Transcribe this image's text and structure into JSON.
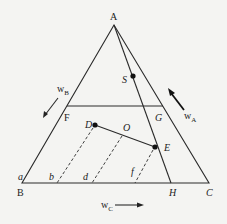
{
  "diagram": {
    "type": "ternary-phase-diagram",
    "vertices": {
      "A": {
        "label": "A",
        "x": 114,
        "y": 25
      },
      "B": {
        "label": "B",
        "x": 22,
        "y": 183
      },
      "C": {
        "label": "C",
        "x": 209,
        "y": 183
      }
    },
    "points": {
      "F": {
        "label": "F",
        "x": 67,
        "y": 106
      },
      "G": {
        "label": "G",
        "x": 163,
        "y": 106
      },
      "H": {
        "label": "H",
        "x": 171,
        "y": 183
      },
      "S": {
        "label": "S",
        "x": 133,
        "y": 76
      },
      "D": {
        "label": "D",
        "x": 95,
        "y": 125
      },
      "E": {
        "label": "E",
        "x": 155,
        "y": 147
      },
      "O": {
        "label": "O",
        "x": 122,
        "y": 134
      }
    },
    "axis_labels": {
      "wB": {
        "main": "w",
        "sub": "B"
      },
      "wA": {
        "main": "w",
        "sub": "A"
      },
      "wC": {
        "main": "w",
        "sub": "C"
      }
    },
    "base_marks": {
      "a": "a",
      "b": "b",
      "d": "d",
      "f": "f"
    },
    "line_color": "#2a2a2a",
    "background": "#f4f4f2"
  }
}
